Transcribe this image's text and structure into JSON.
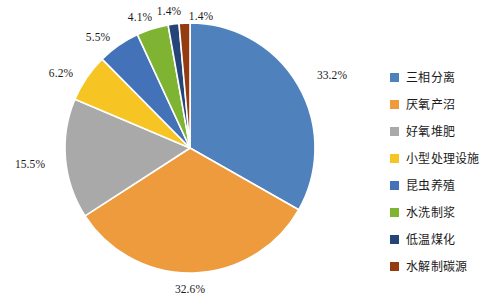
{
  "chart_data": {
    "type": "pie",
    "title": "",
    "xlabel": "",
    "ylabel": "",
    "legend_position": "right",
    "grid": false,
    "start_angle_deg": 0,
    "direction": "clockwise",
    "center": [
      190,
      148
    ],
    "radius": 125,
    "categories": [
      "三相分离",
      "厌氧产沼",
      "好氧堆肥",
      "小型处理设施",
      "昆虫养殖",
      "水洗制浆",
      "低温煤化",
      "水解制碳源"
    ],
    "values": [
      33.2,
      32.6,
      15.5,
      6.2,
      5.5,
      4.1,
      1.4,
      1.4
    ],
    "value_unit": "%",
    "colors": [
      "#4f81bd",
      "#ed9b3c",
      "#a9a9a9",
      "#f6c423",
      "#4472b8",
      "#7fb432",
      "#254478",
      "#953b10"
    ],
    "slices": [
      {
        "label": "三相分离",
        "value": 33.2,
        "display": "33.2%",
        "color": "#4f81bd",
        "label_x": 332,
        "label_y": 76
      },
      {
        "label": "厌氧产沼",
        "value": 32.6,
        "display": "32.6%",
        "color": "#ed9b3c",
        "label_x": 190,
        "label_y": 290
      },
      {
        "label": "好氧堆肥",
        "value": 15.5,
        "display": "15.5%",
        "color": "#a9a9a9",
        "label_x": 30,
        "label_y": 165
      },
      {
        "label": "小型处理设施",
        "value": 6.2,
        "display": "6.2%",
        "color": "#f6c423",
        "label_x": 61,
        "label_y": 74
      },
      {
        "label": "昆虫养殖",
        "value": 5.5,
        "display": "5.5%",
        "color": "#4472b8",
        "label_x": 98,
        "label_y": 38
      },
      {
        "label": "水洗制浆",
        "value": 4.1,
        "display": "4.1%",
        "color": "#7fb432",
        "label_x": 140,
        "label_y": 18
      },
      {
        "label": "低温煤化",
        "value": 1.4,
        "display": "1.4%",
        "color": "#254478",
        "label_x": 169,
        "label_y": 12
      },
      {
        "label": "水解制碳源",
        "value": 1.4,
        "display": "1.4%",
        "color": "#953b10",
        "label_x": 201,
        "label_y": 17
      }
    ]
  },
  "legend": {
    "items": [
      {
        "label": "三相分离",
        "color": "#4f81bd"
      },
      {
        "label": "厌氧产沼",
        "color": "#ed9b3c"
      },
      {
        "label": "好氧堆肥",
        "color": "#a9a9a9"
      },
      {
        "label": "小型处理设施",
        "color": "#f6c423"
      },
      {
        "label": "昆虫养殖",
        "color": "#4472b8"
      },
      {
        "label": "水洗制浆",
        "color": "#7fb432"
      },
      {
        "label": "低温煤化",
        "color": "#254478"
      },
      {
        "label": "水解制碳源",
        "color": "#953b10"
      }
    ]
  },
  "background_color": "#ffffff"
}
